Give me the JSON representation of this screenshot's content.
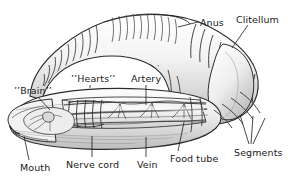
{
  "figure": {
    "background_color": "#ffffff",
    "ink_color": "#1a1a1a",
    "width": 302,
    "height": 184
  },
  "labels": [
    {
      "id": "anus",
      "text": "Anus",
      "x": 200,
      "y": 17,
      "leader": {
        "x1": 198,
        "y1": 22,
        "x2": 178,
        "y2": 27
      }
    },
    {
      "id": "clitellum",
      "text": "Clitellum",
      "x": 236,
      "y": 14,
      "leader": {
        "x1": 248,
        "y1": 25,
        "x2": 232,
        "y2": 48
      }
    },
    {
      "id": "hearts",
      "text": "’’Hearts’’",
      "x": 71,
      "y": 73,
      "leader": {
        "x1": 90,
        "y1": 85,
        "x2": 90,
        "y2": 88
      }
    },
    {
      "id": "artery",
      "text": "Artery",
      "x": 131,
      "y": 73,
      "leader": {
        "x1": 146,
        "y1": 85,
        "x2": 146,
        "y2": 105
      }
    },
    {
      "id": "brain",
      "text": "’’Brain’’",
      "x": 14,
      "y": 85,
      "leader": {
        "x1": 38,
        "y1": 97,
        "x2": 50,
        "y2": 110
      }
    },
    {
      "id": "mouth",
      "text": "Mouth",
      "x": 20,
      "y": 162,
      "leader": {
        "x1": 29,
        "y1": 160,
        "x2": 24,
        "y2": 136
      }
    },
    {
      "id": "nerve-cord",
      "text": "Nerve cord",
      "x": 66,
      "y": 159,
      "leader": {
        "x1": 92,
        "y1": 157,
        "x2": 92,
        "y2": 136
      }
    },
    {
      "id": "vein",
      "text": "Vein",
      "x": 137,
      "y": 159,
      "leader": {
        "x1": 146,
        "y1": 157,
        "x2": 146,
        "y2": 137
      }
    },
    {
      "id": "food-tube",
      "text": "Food tube",
      "x": 170,
      "y": 153,
      "leader": {
        "x1": 178,
        "y1": 151,
        "x2": 184,
        "y2": 122
      }
    },
    {
      "id": "segments",
      "text": "Segments",
      "x": 234,
      "y": 147,
      "leaders": [
        {
          "x1": 249,
          "y1": 144,
          "x2": 240,
          "y2": 115
        },
        {
          "x1": 251,
          "y1": 144,
          "x2": 253,
          "y2": 116
        },
        {
          "x1": 253,
          "y1": 144,
          "x2": 265,
          "y2": 118
        }
      ]
    }
  ]
}
